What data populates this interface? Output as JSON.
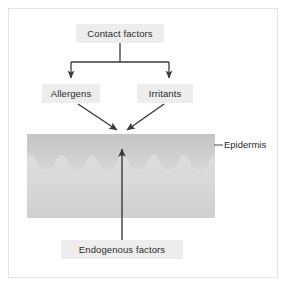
{
  "figure": {
    "background_color": "#ffffff",
    "frame_border_color": "#e3e3e3"
  },
  "nodes": {
    "contact_factors": {
      "label": "Contact factors",
      "box_fill": "#ededed",
      "text_color": "#2b2b2b"
    },
    "allergens": {
      "label": "Allergens",
      "box_fill": "#ededed",
      "text_color": "#2b2b2b"
    },
    "irritants": {
      "label": "Irritants",
      "box_fill": "#ededed",
      "text_color": "#2b2b2b"
    },
    "endogenous_factors": {
      "label": "Endogenous factors",
      "box_fill": "#ededed",
      "text_color": "#2b2b2b"
    }
  },
  "annotations": {
    "epidermis": {
      "label": "Epidermis",
      "text_color": "#2b2b2b",
      "leader_line_color": "#555555"
    }
  },
  "skin_layer": {
    "name": "epidermis-block",
    "upper_band_color_top": "#c9c9c9",
    "upper_band_color_bottom": "#d4d4d4",
    "lower_band_color_top": "#dcdcdc",
    "lower_band_color_bottom": "#d2d2d2",
    "wave_count": 6
  },
  "connectors": {
    "line_color": "#3a3a3a",
    "items": [
      {
        "name": "contact-to-fork",
        "from": "contact_factors",
        "to": "fork",
        "style": "straight"
      },
      {
        "name": "fork-to-allergens",
        "from": "fork",
        "to": "allergens",
        "style": "arrow-down"
      },
      {
        "name": "fork-to-irritants",
        "from": "fork",
        "to": "irritants",
        "style": "arrow-down"
      },
      {
        "name": "allergens-to-epidermis",
        "from": "allergens",
        "to": "skin_layer",
        "style": "arrow-diagonal"
      },
      {
        "name": "irritants-to-epidermis",
        "from": "irritants",
        "to": "skin_layer",
        "style": "arrow-diagonal"
      },
      {
        "name": "endogenous-to-epidermis",
        "from": "endogenous_factors",
        "to": "skin_layer",
        "style": "arrow-up"
      }
    ]
  }
}
